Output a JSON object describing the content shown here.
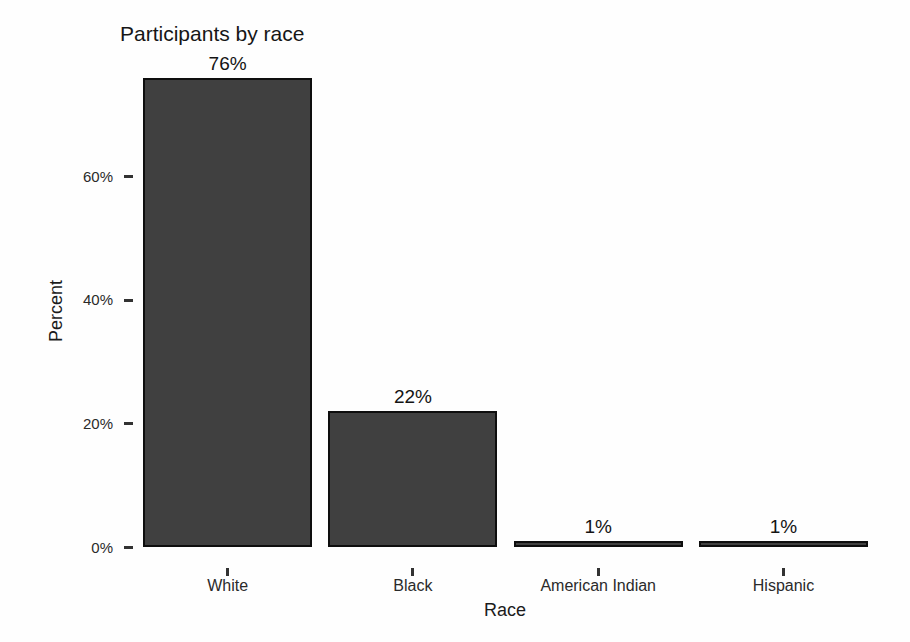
{
  "chart_data": {
    "type": "bar",
    "title": "Participants by race",
    "xlabel": "Race",
    "ylabel": "Percent",
    "categories": [
      "White",
      "Black",
      "American Indian",
      "Hispanic"
    ],
    "values": [
      76,
      22,
      1,
      1
    ],
    "bar_labels": [
      "76%",
      "22%",
      "1%",
      "1%"
    ],
    "yticks": [
      0,
      20,
      40,
      60
    ],
    "ytick_labels": [
      "0%",
      "20%",
      "40%",
      "60%"
    ],
    "ylim": [
      0,
      80
    ],
    "grid": false,
    "legend": "none",
    "axis_lines": "none",
    "bar_fill_color": "#404040",
    "bar_border_color": "#0e0e0e",
    "text_color": "#1b1b1b",
    "background_color": "#fefefe"
  }
}
